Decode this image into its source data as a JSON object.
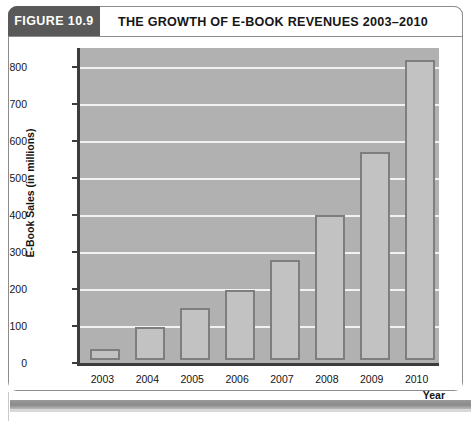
{
  "figure": {
    "tab_label": "FIGURE 10.9",
    "title": "THE GROWTH OF E-BOOK REVENUES 2003–2010"
  },
  "axes": {
    "y_axis_title": "E-Book Sales (in millions)",
    "x_axis_title": "Year",
    "y_ticks": [
      "800",
      "700",
      "600",
      "500",
      "400",
      "300",
      "200",
      "100",
      "0"
    ],
    "x_ticks": [
      "2003",
      "2004",
      "2005",
      "2006",
      "2007",
      "2008",
      "2009",
      "2010"
    ]
  },
  "colors": {
    "tab_background": "#595959",
    "plot_background": "#b1b1b1",
    "gridline": "#f2f2f2",
    "bar_fill": "#c2c2c2",
    "bar_border": "#7e7e7e",
    "axis_line": "#3c3c3c",
    "frame_border": "#8d8d8d",
    "footer_bar": "#8a8a8a"
  },
  "chart_data": {
    "type": "bar",
    "title": "THE GROWTH OF E-BOOK REVENUES 2003–2010",
    "xlabel": "Year",
    "ylabel": "E-Book Sales (in millions)",
    "categories": [
      "2003",
      "2004",
      "2005",
      "2006",
      "2007",
      "2008",
      "2009",
      "2010"
    ],
    "values": [
      30,
      90,
      140,
      190,
      270,
      390,
      560,
      810
    ],
    "ylim": [
      0,
      850
    ],
    "ytick_values": [
      0,
      100,
      200,
      300,
      400,
      500,
      600,
      700,
      800
    ],
    "grid": true,
    "legend": false
  }
}
